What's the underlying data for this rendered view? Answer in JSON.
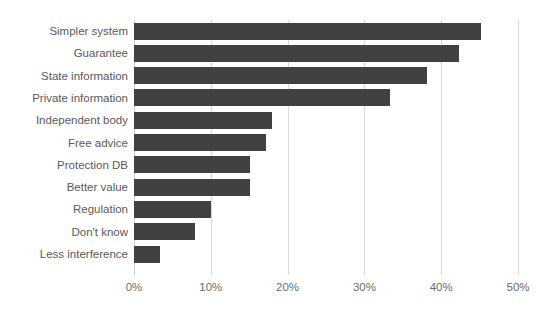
{
  "chart_data": {
    "type": "bar",
    "orientation": "horizontal",
    "title": "",
    "subtitle": "",
    "xlabel": "",
    "ylabel": "",
    "categories": [
      "Simpler system",
      "Guarantee",
      "State information",
      "Private information",
      "Independent body",
      "Free advice",
      "Protection DB",
      "Better value",
      "Regulation",
      "Don't know",
      "Less interference"
    ],
    "values": [
      45.2,
      42.3,
      38.1,
      33.3,
      18.0,
      17.2,
      15.1,
      15.1,
      10.0,
      8.0,
      3.4
    ],
    "value_labels": [
      "45%",
      "42%",
      "38%",
      "33%",
      "18%",
      "17%",
      "15%",
      "15%",
      "10%",
      "8%",
      "3%"
    ],
    "xlim": [
      0,
      50
    ],
    "x_ticks": [
      0,
      10,
      20,
      30,
      40,
      50
    ],
    "x_tick_labels": [
      "0%",
      "10%",
      "20%",
      "30%",
      "40%",
      "50%"
    ],
    "grid": "vertical",
    "legend": null,
    "legend_position": "none",
    "bar_color": "#414141",
    "gridline_color": "#d9d9d9",
    "label_color": "#5a5a5a",
    "tick_label_color": "#6b6b6b",
    "background_color": "#ffffff"
  }
}
